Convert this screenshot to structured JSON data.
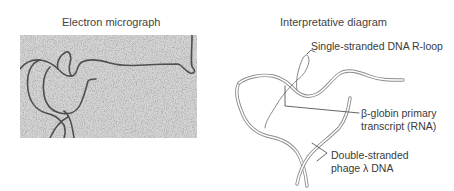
{
  "panels": {
    "left": {
      "title": "Electron micrograph"
    },
    "right": {
      "title": "Interpretative diagram",
      "labels": {
        "r_loop": "Single-stranded DNA R-loop",
        "rna_line1": "β-globin primary",
        "rna_line2": "transcript (RNA)",
        "dsdna_line1": "Double-stranded",
        "dsdna_line2": "phage λ DNA"
      }
    }
  },
  "colors": {
    "micrograph_bg": "#c9c9c9",
    "strand_dark": "#3c3c3c",
    "diagram_stroke": "#8a8a8a",
    "leader_line": "#555555"
  }
}
